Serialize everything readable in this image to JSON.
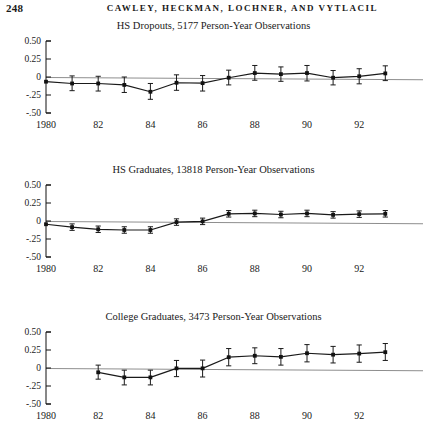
{
  "running_head": {
    "folio": "248",
    "authors": "CAWLEY, HECKMAN, LOCHNER, AND VYTLACIL"
  },
  "axis": {
    "y_ticks": [
      "0.50",
      "0.25",
      "0",
      "-.25",
      "-.50"
    ],
    "y_tick_values": [
      0.5,
      0.25,
      0,
      -0.25,
      -0.5
    ],
    "x_ticks": [
      "1980",
      "82",
      "84",
      "86",
      "88",
      "90",
      "92"
    ],
    "x_tick_values": [
      1980,
      1982,
      1984,
      1986,
      1988,
      1990,
      1992
    ],
    "xlim": [
      1980,
      1993
    ],
    "ylim": [
      -0.5,
      0.5
    ]
  },
  "colors": {
    "ink": "#1a1a1a",
    "zero_line": "#8e8e8e",
    "marker": "#121212",
    "background": "#ffffff"
  },
  "chart_data": [
    {
      "type": "line",
      "title": "HS Dropouts, 5177 Person-Year Observations",
      "group": "HS Dropouts",
      "observations": 5177,
      "xlabel": "",
      "ylabel": "",
      "xlim": [
        1980,
        1993
      ],
      "ylim": [
        -0.5,
        0.5
      ],
      "grid": false,
      "legend": "none",
      "x": [
        1980,
        1981,
        1982,
        1983,
        1984,
        1985,
        1986,
        1987,
        1988,
        1989,
        1990,
        1991,
        1992,
        1993
      ],
      "values": [
        -0.065,
        -0.09,
        -0.09,
        -0.11,
        -0.205,
        -0.08,
        -0.085,
        -0.01,
        0.055,
        0.04,
        0.055,
        -0.01,
        0.01,
        0.05
      ],
      "err_low": [
        -0.065,
        -0.19,
        -0.195,
        -0.215,
        -0.31,
        -0.185,
        -0.195,
        -0.11,
        -0.045,
        -0.06,
        -0.055,
        -0.11,
        -0.095,
        -0.05
      ],
      "err_high": [
        -0.065,
        0.015,
        0.01,
        0.0,
        -0.09,
        0.03,
        0.02,
        0.095,
        0.16,
        0.14,
        0.16,
        0.09,
        0.115,
        0.155
      ]
    },
    {
      "type": "line",
      "title": "HS Graduates, 13818 Person-Year Observations",
      "group": "HS Graduates",
      "observations": 13818,
      "xlabel": "",
      "ylabel": "",
      "xlim": [
        1980,
        1993
      ],
      "ylim": [
        -0.5,
        0.5
      ],
      "grid": false,
      "legend": "none",
      "x": [
        1980,
        1981,
        1982,
        1983,
        1984,
        1985,
        1986,
        1987,
        1988,
        1989,
        1990,
        1991,
        1992,
        1993
      ],
      "values": [
        -0.045,
        -0.085,
        -0.115,
        -0.125,
        -0.125,
        -0.015,
        -0.005,
        0.1,
        0.105,
        0.09,
        0.105,
        0.085,
        0.095,
        0.1
      ],
      "err_low": [
        -0.045,
        -0.13,
        -0.16,
        -0.17,
        -0.17,
        -0.06,
        -0.05,
        0.055,
        0.06,
        0.045,
        0.06,
        0.04,
        0.05,
        0.055
      ],
      "err_high": [
        -0.045,
        -0.04,
        -0.07,
        -0.08,
        -0.08,
        0.03,
        0.04,
        0.145,
        0.15,
        0.135,
        0.15,
        0.13,
        0.14,
        0.145
      ]
    },
    {
      "type": "line",
      "title": "College Graduates, 3473 Person-Year Observations",
      "group": "College Graduates",
      "observations": 3473,
      "xlabel": "",
      "ylabel": "",
      "xlim": [
        1980,
        1993
      ],
      "ylim": [
        -0.5,
        0.5
      ],
      "grid": false,
      "legend": "none",
      "x": [
        1982,
        1983,
        1984,
        1985,
        1986,
        1987,
        1988,
        1989,
        1990,
        1991,
        1992,
        1993
      ],
      "values": [
        -0.06,
        -0.13,
        -0.13,
        -0.005,
        -0.005,
        0.15,
        0.17,
        0.155,
        0.205,
        0.185,
        0.2,
        0.22
      ],
      "err_low": [
        -0.155,
        -0.235,
        -0.235,
        -0.12,
        -0.125,
        0.03,
        0.06,
        0.04,
        0.085,
        0.07,
        0.08,
        0.105
      ],
      "err_high": [
        0.04,
        -0.03,
        -0.03,
        0.105,
        0.11,
        0.27,
        0.28,
        0.27,
        0.325,
        0.3,
        0.32,
        0.34
      ]
    }
  ]
}
